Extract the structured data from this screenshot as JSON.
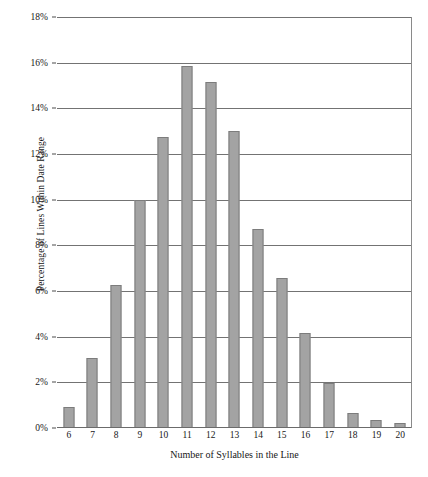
{
  "chart_data": {
    "type": "bar",
    "title": "",
    "xlabel": "Number of Syllables in the Line",
    "ylabel": "Percentage of Lines Within Date Range",
    "categories": [
      "6",
      "7",
      "8",
      "9",
      "10",
      "11",
      "12",
      "13",
      "14",
      "15",
      "16",
      "17",
      "18",
      "19",
      "20"
    ],
    "values": [
      0.9,
      3.05,
      6.25,
      10.0,
      12.75,
      15.85,
      15.15,
      13.0,
      8.7,
      6.55,
      4.15,
      1.95,
      0.65,
      0.35,
      0.2
    ],
    "ytick_labels": [
      "0%",
      "2%",
      "4%",
      "6%",
      "8%",
      "10%",
      "12%",
      "14%",
      "16%",
      "18%"
    ],
    "ytick_values": [
      0,
      2,
      4,
      6,
      8,
      10,
      12,
      14,
      16,
      18
    ],
    "ylim": [
      0,
      18
    ],
    "grid": true,
    "legend": "none",
    "bar_color": "#a3a3a3",
    "bar_border_color": "#7c7c7c",
    "gridline_color": "#737373",
    "text_color": "#171717"
  },
  "caption_sliver": " "
}
